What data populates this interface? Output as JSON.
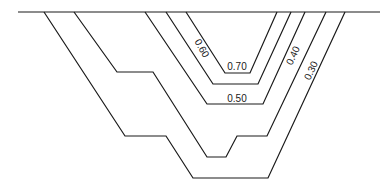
{
  "diagram": {
    "type": "isoline cross-section",
    "ground_line": {
      "x1": 18,
      "y1": 12,
      "x2": 380,
      "y2": 12
    },
    "contours": [
      {
        "label": "0.70",
        "points": "186,12 225,73 250,73 277,12",
        "label_pos": {
          "x": 237,
          "y": 70,
          "rotate": 0
        }
      },
      {
        "label": "0.60",
        "points": "166,12 213,84 258,84 291,12",
        "label_pos": {
          "x": 199,
          "y": 50,
          "rotate": 60
        }
      },
      {
        "label": "0.50",
        "points": "145,12 207,104 263,104 305,12",
        "label_pos": {
          "x": 237,
          "y": 102,
          "rotate": 0
        }
      },
      {
        "label": "0.40",
        "points": "74,12 117,72 153,72 207,157 226,157 237,136 267,136 326,12",
        "label_pos": {
          "x": 296,
          "y": 57,
          "rotate": -65
        }
      },
      {
        "label": "0.30",
        "points": "44,12 125,136 166,136 193,178 268,178 345,12",
        "label_pos": {
          "x": 314,
          "y": 72,
          "rotate": -65
        }
      }
    ]
  }
}
